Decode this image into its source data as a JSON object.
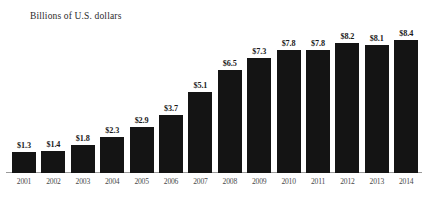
{
  "chart_data": {
    "type": "bar",
    "title": "Billions of U.S. dollars",
    "xlabel": "",
    "ylabel": "",
    "ylim": [
      0,
      9.3
    ],
    "grid": false,
    "legend": null,
    "categories": [
      "2001",
      "2002",
      "2003",
      "2004",
      "2005",
      "2006",
      "2007",
      "2008",
      "2009",
      "2010",
      "2011",
      "2012",
      "2013",
      "2014"
    ],
    "values": [
      1.3,
      1.4,
      1.8,
      2.3,
      2.9,
      3.7,
      5.1,
      6.5,
      7.3,
      7.8,
      7.8,
      8.2,
      8.1,
      8.4
    ],
    "data_labels": [
      "$1.3",
      "$1.4",
      "$1.8",
      "$2.3",
      "$2.9",
      "$3.7",
      "$5.1",
      "$6.5",
      "$7.3",
      "$7.8",
      "$7.8",
      "$8.2",
      "$8.1",
      "$8.4"
    ],
    "bar_color": "#141414",
    "axis_color": "#9a9a9a",
    "background_color": "#ffffff",
    "title_color": "#2b2b2b",
    "label_color": "#4a4a4a"
  }
}
